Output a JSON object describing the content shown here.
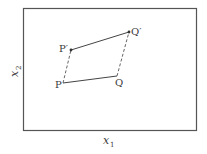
{
  "diagram": {
    "frame": {
      "x": 23,
      "y": 8,
      "width": 173,
      "height": 122,
      "stroke": "#555555"
    },
    "axes": {
      "x_label": "x",
      "x_sub": "1",
      "y_label": "x",
      "y_sub": "2"
    },
    "points": [
      {
        "id": "P",
        "label": "P",
        "x": 63,
        "y": 83
      },
      {
        "id": "Q",
        "label": "Q",
        "x": 117,
        "y": 76
      },
      {
        "id": "Pp",
        "label": "P′",
        "x": 71,
        "y": 50
      },
      {
        "id": "Qp",
        "label": "Q′",
        "x": 129,
        "y": 32
      }
    ],
    "segments": [
      {
        "from": "P",
        "to": "Q",
        "style": "solid"
      },
      {
        "from": "Pp",
        "to": "Qp",
        "style": "solid-arrow"
      },
      {
        "from": "P",
        "to": "Pp",
        "style": "dashed"
      },
      {
        "from": "Q",
        "to": "Qp",
        "style": "dashed"
      }
    ],
    "line_color": "#444444"
  }
}
